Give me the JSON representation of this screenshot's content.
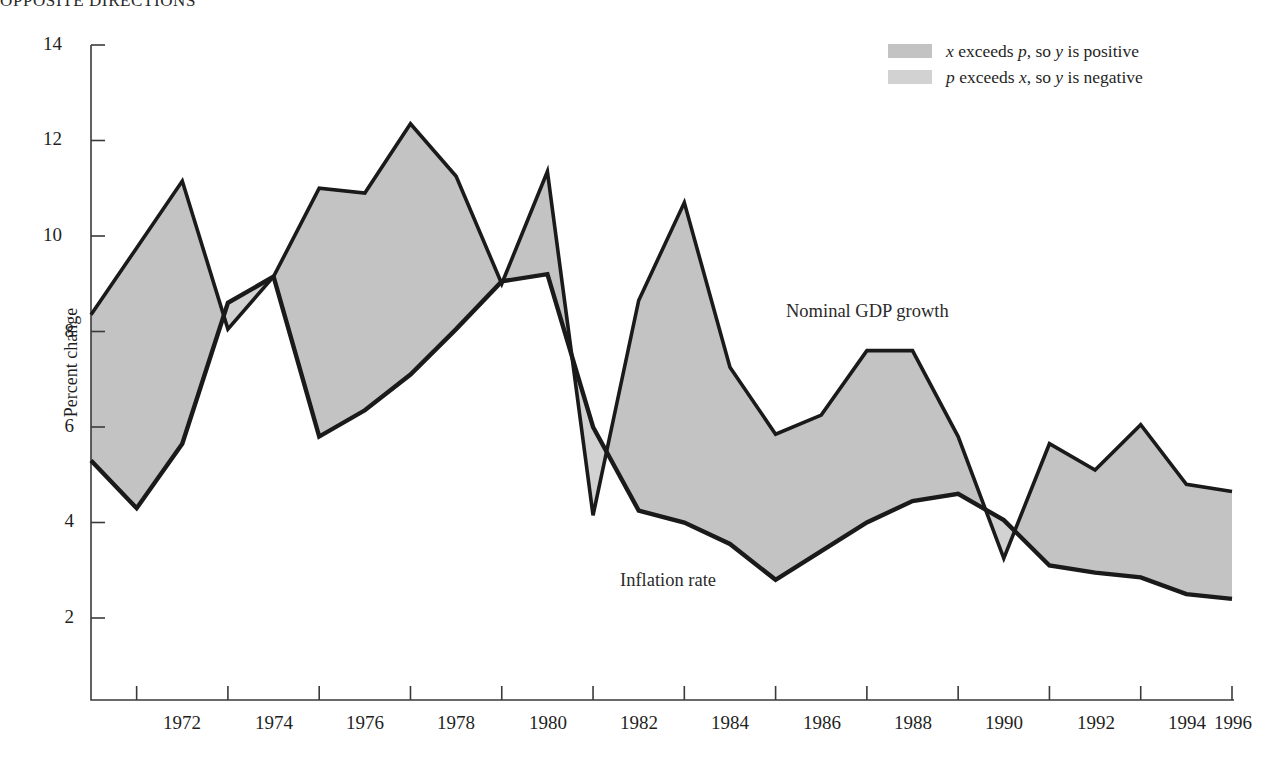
{
  "headline": "OPPOSITE DIRECTIONS",
  "legend": {
    "position": "top-right",
    "items": [
      {
        "swatch_color": "#c3c3c3",
        "prefix": "x",
        "mid": " exceeds ",
        "var2": "p",
        "suffix": ", so ",
        "var3": "y",
        "tail": " is positive",
        "full_text": "x exceeds p, so y is positive"
      },
      {
        "swatch_color": "#d2d2d2",
        "prefix": "p",
        "mid": " exceeds ",
        "var2": "x",
        "suffix": ", so ",
        "var3": "y",
        "tail": " is negative",
        "full_text": "p exceeds x, so y is negative"
      }
    ]
  },
  "annotations": {
    "gdp_label": "Nominal GDP growth",
    "inflation_label": "Inflation rate"
  },
  "axes": {
    "ylabel": "Percent change",
    "yticks": [
      "2",
      "4",
      "6",
      "8",
      "10",
      "12",
      "14"
    ],
    "xticks": [
      "1972",
      "1974",
      "1976",
      "1978",
      "1980",
      "1982",
      "1984",
      "1986",
      "1988",
      "1990",
      "1992",
      "1994",
      "1996"
    ]
  },
  "colors": {
    "line": "#1a1a1a",
    "fill_positive": "#c3c3c3",
    "fill_negative": "#d2d2d2",
    "axis": "#3a3a3a",
    "background": "#ffffff"
  },
  "chart_data": {
    "type": "line",
    "title": "OPPOSITE DIRECTIONS",
    "xlabel": "",
    "ylabel": "Percent change",
    "xlim": [
      1971,
      1996
    ],
    "ylim": [
      1.0,
      14.0
    ],
    "grid": false,
    "legend_position": "top-right",
    "x": [
      1971,
      1972,
      1973,
      1974,
      1975,
      1976,
      1977,
      1978,
      1979,
      1980,
      1981,
      1982,
      1983,
      1984,
      1985,
      1986,
      1987,
      1988,
      1989,
      1990,
      1991,
      1992,
      1993,
      1994,
      1995,
      1996
    ],
    "series": [
      {
        "name": "Nominal GDP growth",
        "values": [
          8.35,
          9.75,
          11.15,
          8.05,
          9.15,
          11.0,
          10.9,
          12.35,
          11.25,
          9.0,
          11.35,
          4.15,
          8.65,
          10.7,
          7.25,
          5.85,
          6.25,
          7.6,
          7.6,
          5.8,
          3.25,
          5.65,
          5.1,
          6.05,
          4.8,
          4.65
        ]
      },
      {
        "name": "Inflation rate",
        "values": [
          5.3,
          4.3,
          5.65,
          8.6,
          9.15,
          5.8,
          6.35,
          7.1,
          8.05,
          9.05,
          9.2,
          6.0,
          4.25,
          4.0,
          3.55,
          2.8,
          3.4,
          4.0,
          4.45,
          4.6,
          4.05,
          3.1,
          2.95,
          2.85,
          2.5,
          2.4
        ]
      }
    ],
    "shading_note": "Area between the two series is shaded; darker gray where GDP growth (x) exceeds inflation (p), lighter gray where inflation exceeds GDP growth."
  }
}
